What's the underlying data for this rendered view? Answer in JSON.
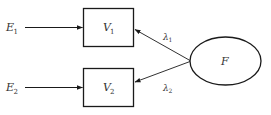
{
  "diagram": {
    "type": "path-diagram",
    "colors": {
      "stroke": "#1a1a1a",
      "text": "#333333",
      "background": "#ffffff"
    },
    "nodes": {
      "e1": {
        "label": "E",
        "subscript": "1",
        "shape": "text"
      },
      "e2": {
        "label": "E",
        "subscript": "2",
        "shape": "text"
      },
      "v1": {
        "label": "V",
        "subscript": "1",
        "shape": "rectangle"
      },
      "v2": {
        "label": "V",
        "subscript": "2",
        "shape": "rectangle"
      },
      "f": {
        "label": "F",
        "shape": "ellipse"
      }
    },
    "edges": {
      "e1_v1": {
        "from": "E1",
        "to": "V1"
      },
      "e2_v2": {
        "from": "E2",
        "to": "V2"
      },
      "f_v1": {
        "from": "F",
        "to": "V1",
        "label": "λ",
        "subscript": "1"
      },
      "f_v2": {
        "from": "F",
        "to": "V2",
        "label": "λ",
        "subscript": "2"
      }
    }
  }
}
